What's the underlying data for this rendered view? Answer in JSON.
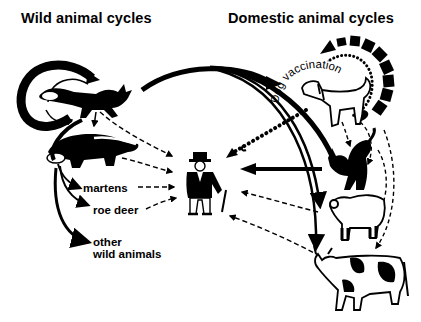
{
  "titles": {
    "wild": "Wild animal cycles",
    "domestic": "Domestic animal cycles"
  },
  "labels": {
    "martens": "martens",
    "roe_deer": "roe deer",
    "other_line1": "other",
    "other_line2": "wild animals",
    "vaccination": "Dog vaccination"
  },
  "nodes": {
    "wild": [
      "fox",
      "badger",
      "martens",
      "roe deer",
      "other wild animals"
    ],
    "domestic": [
      "dog",
      "cat",
      "sheep",
      "cow"
    ],
    "center": "human"
  },
  "edges": {
    "solid": [
      "fox->fox (cycle)",
      "fox->badger",
      "fox->martens",
      "fox->roe deer",
      "fox->other wild animals",
      "fox->dog",
      "fox->cat",
      "fox->sheep",
      "fox->cow",
      "cat->human"
    ],
    "dashed": [
      "fox->human",
      "badger->human",
      "martens->human",
      "roe deer->human",
      "dog->cat",
      "cat->sheep",
      "dog->cow",
      "sheep->human",
      "cow->human"
    ],
    "dotted": [
      "dog->human",
      "dog->dog (vaccination cycle)"
    ]
  },
  "colors": {
    "ink": "#000000",
    "paper": "#ffffff"
  }
}
